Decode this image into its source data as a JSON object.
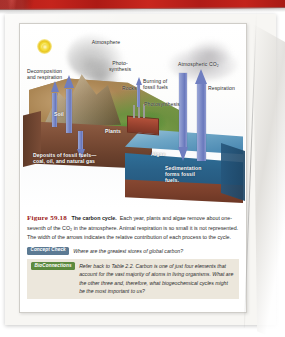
{
  "page": {
    "banner_color": "#c0211b",
    "paper_color": "#f7f6f3"
  },
  "figure": {
    "labels": [
      {
        "key": "atmosphere",
        "text": "Atmosphere"
      },
      {
        "key": "photosynthesis_land",
        "text": "Photo-\nsynthesis"
      },
      {
        "key": "decomposition",
        "text": "Decomposition\nand respiration"
      },
      {
        "key": "rocks",
        "text": "Rocks"
      },
      {
        "key": "atmospheric_co2",
        "text": "Atmospheric CO₂"
      },
      {
        "key": "burning",
        "text": "Burning of\nfossil fuels"
      },
      {
        "key": "respiration",
        "text": "Respiration"
      },
      {
        "key": "photosynthesis_sea",
        "text": "Photosynthesis"
      },
      {
        "key": "soil",
        "text": "Soil"
      },
      {
        "key": "plants",
        "text": "Plants"
      },
      {
        "key": "algae",
        "text": "Algae"
      },
      {
        "key": "deposits",
        "text": "Deposits of fossil fuels—\ncoal, oil, and natural gas"
      },
      {
        "key": "sedimentation",
        "text": "Sedimentation\nforms fossil\nfuels."
      }
    ],
    "sun": "sun-icon",
    "arrow_color": "#6f7ec0"
  },
  "caption": {
    "figure_number": "Figure 59.18",
    "figure_title": "The carbon cycle.",
    "body": "Each year, plants and algae remove about one-seventh of the CO₂ in the atmosphere. Animal respiration is so small it is not represented. The width of the arrows indicates the relative contribution of each process to the cycle."
  },
  "concept_check": {
    "badge": "Concept Check",
    "question": "Where are the greatest stores of global carbon?"
  },
  "bioconnections": {
    "badge": "BioConnections",
    "question": "Refer back to Table 2.2. Carbon is one of just four elements that account for the vast majority of atoms in living organisms. What are the other three and, therefore, what biogeochemical cycles might be the most important to us?",
    "background": "#ece7dc"
  }
}
